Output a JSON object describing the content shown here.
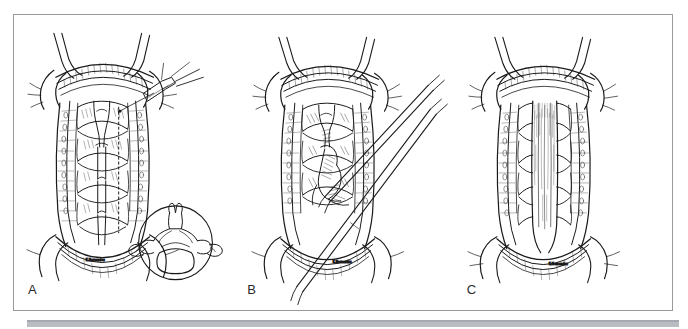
{
  "figure": {
    "kind": "surgical-line-drawing-figure",
    "background_color": "#ffffff",
    "border_color": "#9a9a9a",
    "ink_color": "#1a1a1a",
    "panel_count": 3,
    "panels": [
      {
        "label": "A",
        "name": "panel-a",
        "description": "Posterior cervical exposure with midline structures outlined; dotted line marks the planned osteotomy; a fine instrument tip with suture enters from the upper right. Inset circle at lower right shows the axial cross-section of a vertebra.",
        "has_inset": true,
        "inset_description": "axial vertebral cross-section",
        "has_dotted_guideline": true,
        "signature": "K. Hernandez"
      },
      {
        "label": "B",
        "name": "panel-b",
        "description": "Same exposure with long surgical instruments entering obliquely from the lower right; lamina elevated and hinged open.",
        "has_inset": false,
        "instrument_count": 2,
        "signature": "K. Hernandez"
      },
      {
        "label": "C",
        "name": "panel-c",
        "description": "Completed result: the midline defect is covered by a smooth longitudinal graft/membrane with the paraspinal retractors in place.",
        "has_inset": false,
        "signature": "K. Hernandez"
      }
    ]
  },
  "bottom_bar": {
    "name": "page-footer-rule",
    "color": "#b9bcc1"
  }
}
